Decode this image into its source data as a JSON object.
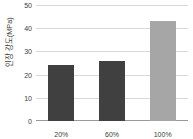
{
  "chart_data": {
    "type": "bar",
    "title": "",
    "subtitle": "",
    "xlabel": "",
    "ylabel": "인장 강도(MPa)",
    "categories": [
      "20%",
      "60%",
      "100%"
    ],
    "values": [
      24,
      26,
      43
    ],
    "series": [
      {
        "name": "인장 강도(MPa)",
        "values": [
          24,
          26,
          43
        ],
        "colors": [
          "#404040",
          "#404040",
          "#a6a6a6"
        ]
      }
    ],
    "ylim": [
      0,
      50
    ],
    "ytick_labels": [
      "0",
      "10",
      "20",
      "30",
      "40",
      "50"
    ],
    "ytick_values": [
      0,
      10,
      20,
      30,
      40,
      50
    ],
    "grid": "horizontal",
    "legend": "none",
    "annotations": []
  },
  "colors": {
    "bar_dark": "#404040",
    "bar_light": "#a6a6a6",
    "gridline": "#d9d9d9",
    "axis": "#9a9a9a",
    "text": "#3c3c3c",
    "background": "#ffffff"
  }
}
